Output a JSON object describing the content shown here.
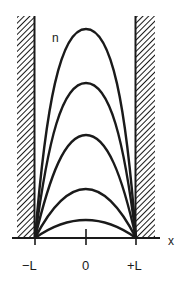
{
  "diagram": {
    "type": "standing-wave modes in infinite square well",
    "labels": {
      "y_axis": "n",
      "x_axis": "x",
      "left_boundary": "−L",
      "center": "0",
      "right_boundary": "+L"
    },
    "walls": {
      "left": {
        "position": "−L",
        "style": "hatched"
      },
      "right": {
        "position": "+L",
        "style": "hatched"
      }
    },
    "curves": [
      {
        "index": 1,
        "shape": "arch",
        "relative_height": 0.08
      },
      {
        "index": 2,
        "shape": "arch",
        "relative_height": 0.24
      },
      {
        "index": 3,
        "shape": "arch",
        "relative_height": 0.5
      },
      {
        "index": 4,
        "shape": "arch",
        "relative_height": 0.74
      },
      {
        "index": 5,
        "shape": "arch",
        "relative_height": 1.0
      }
    ],
    "colors": {
      "ink": "#1a1a1a",
      "background": "#ffffff"
    }
  }
}
